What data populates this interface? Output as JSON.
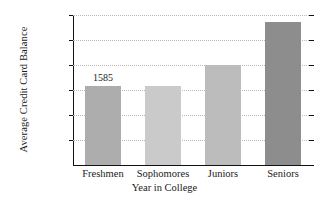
{
  "chart_data": {
    "type": "bar",
    "title": "",
    "xlabel": "Year in College",
    "ylabel": "Average Credit Card Balance",
    "categories": [
      "Freshmen",
      "Sophomores",
      "Juniors",
      "Seniors"
    ],
    "values": [
      1585,
      1580,
      2000,
      2860
    ],
    "data_labels": [
      "1585",
      "",
      "",
      ""
    ],
    "ylim": [
      0,
      3000
    ],
    "yticks": [
      500,
      1000,
      1500,
      2000,
      2500,
      3000
    ],
    "ytick_labels": [
      "$500",
      "$1000",
      "$1500",
      "$2000",
      "$2500",
      "$3000"
    ],
    "grid": true,
    "grid_axis": "y",
    "legend": false,
    "bar_colors": [
      "#adadad",
      "#cacaca",
      "#bcbcbc",
      "#8d8d8d"
    ],
    "axis_color": "#111111",
    "grid_color": "#b9b9b9"
  }
}
